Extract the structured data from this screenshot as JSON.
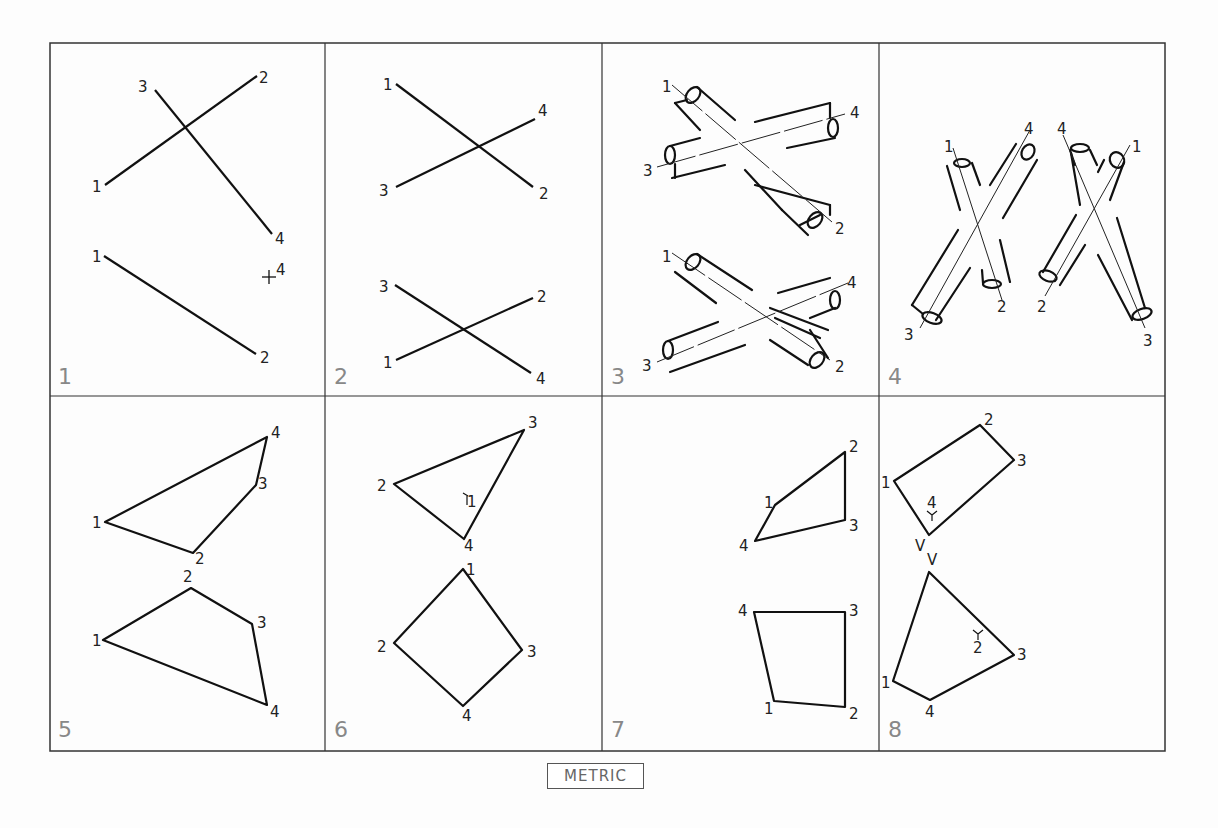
{
  "footer": {
    "badge": "METRIC"
  },
  "panels": [
    {
      "number": "1",
      "elements": "two line segments 1-2 and 3-4 (top view), line 1-2 with point 4 marked (front view)"
    },
    {
      "number": "2",
      "elements": "crossing lines 1-2 and 3-4, two views"
    },
    {
      "number": "3",
      "elements": "two crossing pipes 1-2 and 3-4, two views"
    },
    {
      "number": "4",
      "elements": "two crossing pipes 1-2 and 3-4, two views side by side"
    },
    {
      "number": "5",
      "elements": "quadrilateral 1-2-3-4, two views"
    },
    {
      "number": "6",
      "elements": "triangle 2-3-4 with point 1 inside, and quadrilateral 1-3-4-2"
    },
    {
      "number": "7",
      "elements": "quadrilateral 1-2-3-4, two views"
    },
    {
      "number": "8",
      "elements": "pyramid / plane with vertex V, points 1-4, two views"
    }
  ],
  "labels": {
    "p1": {
      "top": [
        "3",
        "2",
        "1",
        "4"
      ],
      "bottom": [
        "1",
        "4",
        "2"
      ]
    },
    "p2": {
      "top": [
        "1",
        "4",
        "3",
        "2"
      ],
      "bottom": [
        "3",
        "2",
        "1",
        "4"
      ]
    },
    "p3": {
      "top": [
        "1",
        "4",
        "3",
        "2"
      ],
      "bottom": [
        "1",
        "4",
        "3",
        "2"
      ]
    },
    "p4": {
      "left": [
        "1",
        "4",
        "3",
        "2"
      ],
      "right": [
        "4",
        "1",
        "2",
        "3"
      ]
    },
    "p5": {
      "top": [
        "4",
        "3",
        "1",
        "2"
      ],
      "bottom": [
        "2",
        "3",
        "1",
        "4"
      ]
    },
    "p6": {
      "top": [
        "3",
        "2",
        "1",
        "4"
      ],
      "bottom": [
        "1",
        "2",
        "3",
        "4"
      ]
    },
    "p7": {
      "top": [
        "2",
        "1",
        "3",
        "4"
      ],
      "bottom": [
        "4",
        "3",
        "1",
        "2"
      ]
    },
    "p8": {
      "top": [
        "2",
        "3",
        "1",
        "4",
        "V"
      ],
      "bottom": [
        "V",
        "2",
        "3",
        "1",
        "4"
      ]
    }
  }
}
